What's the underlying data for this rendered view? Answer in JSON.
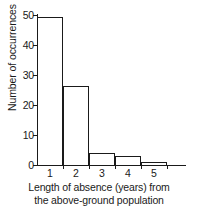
{
  "chart_data": {
    "type": "bar",
    "title": "",
    "subtitle": "",
    "xlabel_line1": "Length of absence (years) from",
    "xlabel_line2": "the above-ground population",
    "xlabel": "Length of absence (years) from the above-ground population",
    "ylabel": "Number of occurrences",
    "categories": [
      "1",
      "2",
      "3",
      "4",
      "5"
    ],
    "values": [
      49,
      26,
      4,
      3,
      1
    ],
    "bin_edges": [
      0.5,
      1.5,
      2.5,
      3.5,
      4.5,
      5.5
    ],
    "xtick_labels": [
      "1",
      "2",
      "3",
      "4",
      "5"
    ],
    "ytick_labels": [
      "0",
      "10",
      "20",
      "30",
      "40",
      "50"
    ],
    "ytick_values": [
      0,
      10,
      20,
      30,
      40,
      50
    ],
    "ylim": [
      0,
      50
    ],
    "xlim": [
      0.5,
      5.5
    ],
    "grid": false,
    "legend": null,
    "bar_style": "outline",
    "bar_fill_color": "#ffffff",
    "bar_edge_color": "#1a1a1a",
    "axis_color": "#1a1a1a",
    "background_color": "#ffffff"
  }
}
